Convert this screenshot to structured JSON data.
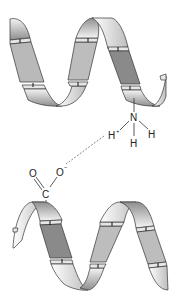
{
  "diagram": {
    "top_helix": {
      "label": "upper helix",
      "residue_group": "ammonium",
      "atoms": {
        "n": "N",
        "h_plus": "H",
        "h_plus_charge": "+",
        "h_right": "H",
        "h_bottom": "H"
      }
    },
    "bottom_helix": {
      "label": "lower helix",
      "residue_group": "carboxylate",
      "atoms": {
        "c": "C",
        "o_double": "O",
        "o_minus": "O",
        "o_minus_charge": "−"
      }
    },
    "interaction": {
      "type": "ionic interaction",
      "style": "dashed"
    },
    "colors": {
      "ribbon_light": "#f2f2f2",
      "ribbon_mid": "#bdbdbd",
      "ribbon_dark": "#8a8a8a",
      "outline": "#333333",
      "dash": "#555555"
    }
  }
}
